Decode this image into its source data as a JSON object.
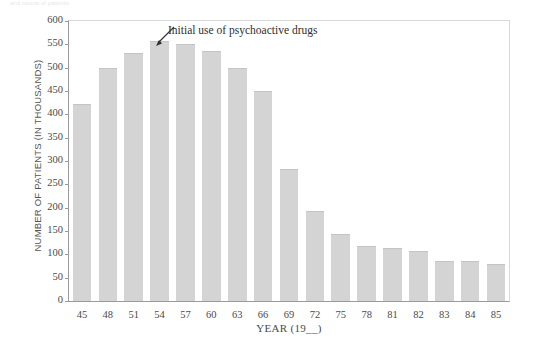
{
  "figure": {
    "top_caption": "and counts of patients"
  },
  "chart_data": {
    "type": "bar",
    "title": "",
    "subtitle": "",
    "xlabel": "YEAR (19__)",
    "ylabel": "NUMBER OF PATIENTS (IN THOUSANDS)",
    "categories": [
      "45",
      "48",
      "51",
      "54",
      "57",
      "60",
      "63",
      "66",
      "69",
      "72",
      "75",
      "78",
      "81",
      "82",
      "83",
      "84",
      "85"
    ],
    "values": [
      422,
      499,
      531,
      557,
      550,
      536,
      500,
      450,
      283,
      193,
      143,
      118,
      113,
      108,
      86,
      86,
      80
    ],
    "ylim": [
      0,
      600
    ],
    "yticks": [
      0,
      50,
      100,
      150,
      200,
      250,
      300,
      350,
      400,
      450,
      500,
      550,
      600
    ],
    "ytick_labels": [
      "0",
      "50",
      "100",
      "150",
      "200",
      "250",
      "300",
      "350",
      "400",
      "450",
      "500",
      "550",
      "600"
    ],
    "grid": false,
    "legend": false,
    "bar_color": "#d4d4d4",
    "axis_color": "#9a9a9a",
    "annotations": [
      {
        "text": "Initial use of psychoactive drugs",
        "points_to_category": "54",
        "arrow": "up-right-to-down-left"
      }
    ]
  }
}
